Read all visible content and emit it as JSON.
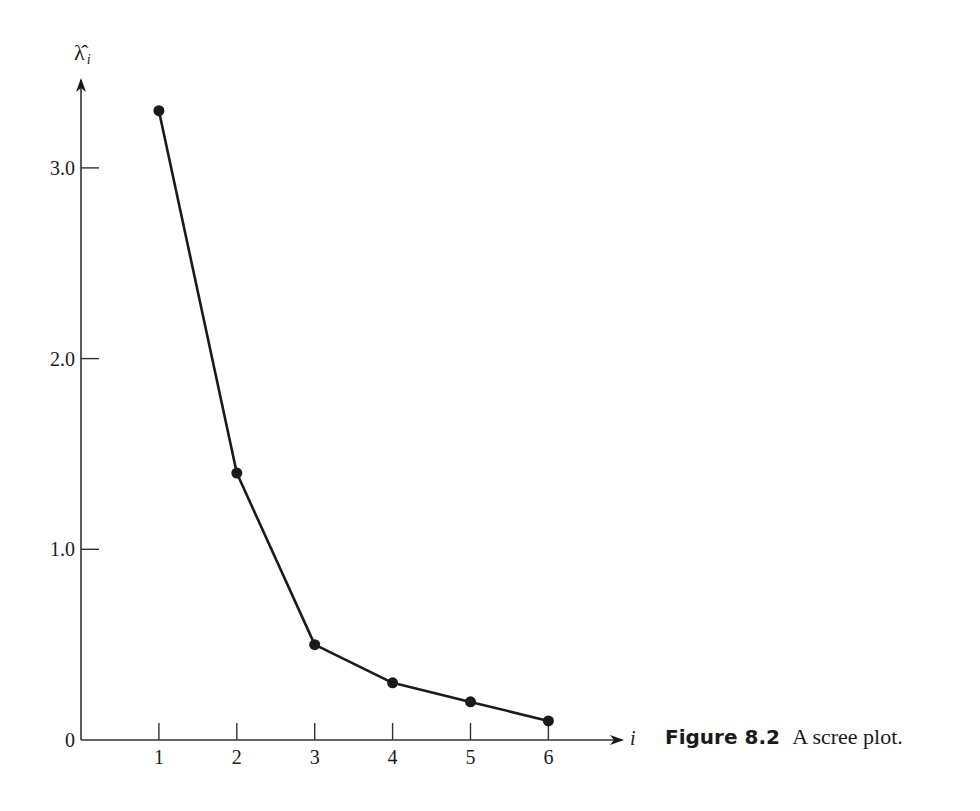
{
  "figure": {
    "number_label": "Figure 8.2",
    "caption_text": "A scree plot."
  },
  "axes": {
    "y_label_symbol": "λ̂",
    "y_label_subscript": "i",
    "x_label": "i",
    "y_tick_labels": [
      "0",
      "1.0",
      "2.0",
      "3.0"
    ],
    "x_tick_labels": [
      "1",
      "2",
      "3",
      "4",
      "5",
      "6"
    ]
  },
  "colors": {
    "line": "#1a1a1a",
    "marker": "#1a1a1a",
    "axis": "#333333",
    "background": "#ffffff"
  },
  "chart_data": {
    "type": "line",
    "title": "A scree plot.",
    "figure_label": "Figure 8.2",
    "xlabel": "i",
    "ylabel": "λ̂_i",
    "x": [
      1,
      2,
      3,
      4,
      5,
      6
    ],
    "values": [
      3.3,
      1.4,
      0.5,
      0.3,
      0.2,
      0.1
    ],
    "series": [
      {
        "name": "eigenvalue",
        "values": [
          3.3,
          1.4,
          0.5,
          0.3,
          0.2,
          0.1
        ]
      }
    ],
    "y_ticks": [
      0,
      1.0,
      2.0,
      3.0
    ],
    "x_ticks": [
      1,
      2,
      3,
      4,
      5,
      6
    ],
    "ylim": [
      0,
      3.5
    ],
    "xlim": [
      0,
      6.8
    ],
    "grid": false,
    "markers": true,
    "legend": null
  }
}
